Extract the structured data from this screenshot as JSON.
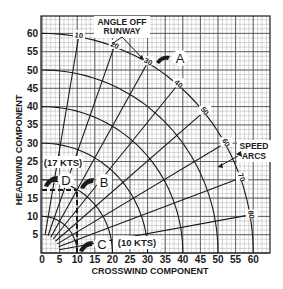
{
  "chart_data": {
    "type": "line",
    "xlabel": "CROSSWIND COMPONENT",
    "ylabel": "HEADWIND COMPONENT",
    "xlim": [
      0,
      65
    ],
    "ylim": [
      0,
      65
    ],
    "grid": true,
    "x_ticks": [
      0,
      5,
      10,
      15,
      20,
      25,
      30,
      35,
      40,
      45,
      50,
      55,
      60
    ],
    "y_ticks": [
      5,
      10,
      15,
      20,
      25,
      30,
      35,
      40,
      45,
      50,
      55,
      60
    ],
    "speed_arcs_kts": [
      10,
      20,
      30,
      40,
      50,
      60
    ],
    "angle_lines_deg": [
      10,
      20,
      30,
      40,
      50,
      60,
      70,
      80
    ],
    "angle_labels": [
      "10",
      "20",
      "30",
      "40",
      "50",
      "60",
      "70",
      "80"
    ],
    "annotations": [
      {
        "text": "ANGLE OFF RUNWAY",
        "points_to": "angle labels on outer arc"
      },
      {
        "text": "SPEED ARCS",
        "points_to": "speed arcs"
      },
      {
        "label": "A",
        "description": "marker at 30° angle on 60 kt arc"
      },
      {
        "label": "B",
        "description": "marker on 20° line near 20 kt headwind / 10 kt crosswind"
      },
      {
        "label": "C",
        "description": "marker on x-axis at 10 kt crosswind"
      },
      {
        "label": "D",
        "description": "marker on y-axis at ~17 kt headwind"
      },
      {
        "text": "(17 KTS)",
        "refers_to": "D headwind component"
      },
      {
        "text": "(10 KTS)",
        "refers_to": "C crosswind component"
      }
    ],
    "example_reading": {
      "headwind_kts": 17,
      "crosswind_kts": 10
    }
  },
  "labels": {
    "xlabel": "CROSSWIND COMPONENT",
    "ylabel": "HEADWIND COMPONENT",
    "angle_title_1": "ANGLE OFF",
    "angle_title_2": "RUNWAY",
    "speed_1": "SPEED",
    "speed_2": "ARCS",
    "point_a": "A",
    "point_b": "B",
    "point_c": "C",
    "point_d": "D",
    "kts_17": "(17 KTS)",
    "kts_10": "(10 KTS)"
  },
  "colors": {
    "ink": "#1a1a1a",
    "grid": "#555555",
    "background": "#ffffff"
  }
}
